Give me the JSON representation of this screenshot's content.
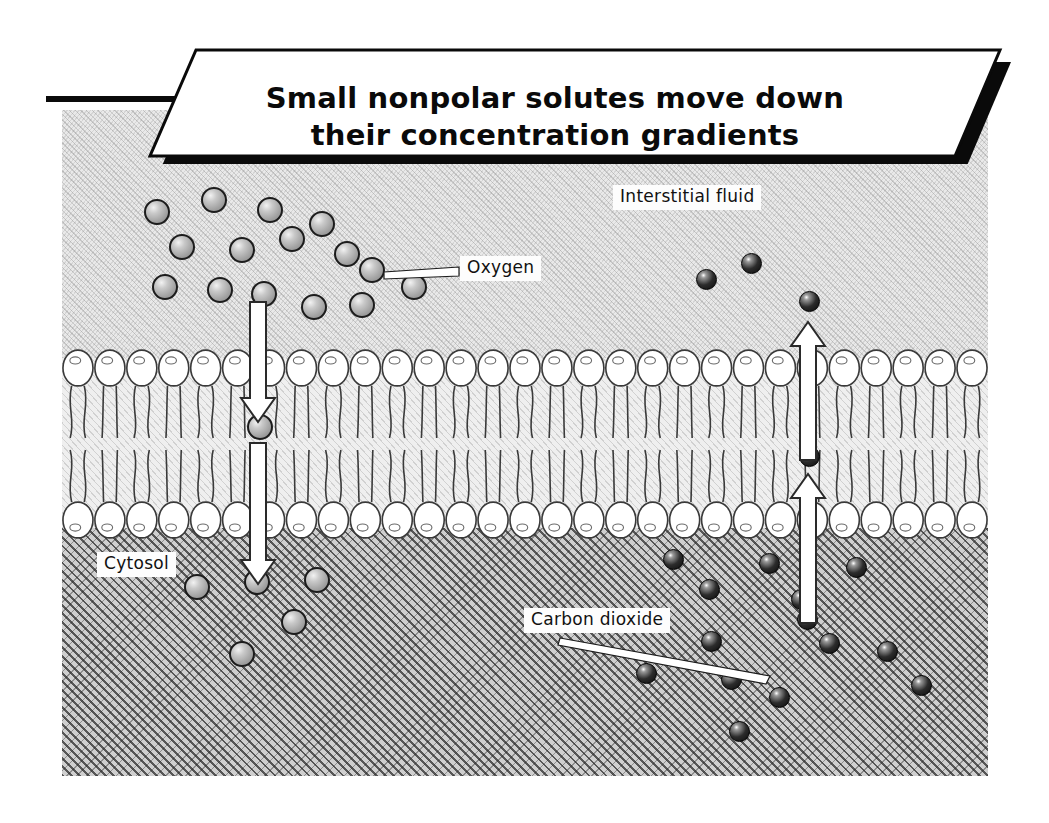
{
  "title": {
    "line1": "Small nonpolar solutes move down",
    "line2": "their concentration gradients"
  },
  "labels": {
    "interstitial_fluid": "Interstitial fluid",
    "cytosol": "Cytosol",
    "oxygen": "Oxygen",
    "carbon_dioxide": "Carbon dioxide"
  },
  "colors": {
    "oxygen_fill": "#9e9e9e",
    "oxygen_stroke": "#1c1c1c",
    "carbon_dioxide_fill": "#141414",
    "carbon_dioxide_stroke": "#000000",
    "interstitial_fluid_bg": "#e9e9e9",
    "cytosol_bg": "#cfcfcf",
    "membrane_bg": "#efefef",
    "phospholipid_head": "#ffffff",
    "banner_bg": "#ffffff",
    "banner_shadow": "#000000",
    "label_bg": "#fdfdfd",
    "text": "#0a0a0a"
  },
  "diagram": {
    "phospholipid_head_count_per_row": 29,
    "oxygen_molecules_interstitial": [
      {
        "x": 155,
        "y": 210
      },
      {
        "x": 212,
        "y": 198
      },
      {
        "x": 268,
        "y": 208
      },
      {
        "x": 320,
        "y": 222
      },
      {
        "x": 180,
        "y": 245
      },
      {
        "x": 240,
        "y": 248
      },
      {
        "x": 290,
        "y": 237
      },
      {
        "x": 345,
        "y": 252
      },
      {
        "x": 370,
        "y": 268
      },
      {
        "x": 163,
        "y": 285
      },
      {
        "x": 218,
        "y": 288
      },
      {
        "x": 262,
        "y": 292
      },
      {
        "x": 312,
        "y": 305
      },
      {
        "x": 360,
        "y": 303
      },
      {
        "x": 412,
        "y": 285
      }
    ],
    "oxygen_molecule_in_membrane": {
      "x": 258,
      "y": 425
    },
    "oxygen_molecules_cytosol": [
      {
        "x": 195,
        "y": 585
      },
      {
        "x": 255,
        "y": 580
      },
      {
        "x": 315,
        "y": 578
      },
      {
        "x": 292,
        "y": 620
      },
      {
        "x": 240,
        "y": 652
      }
    ],
    "co2_molecules_interstitial": [
      {
        "x": 705,
        "y": 278
      },
      {
        "x": 750,
        "y": 262
      },
      {
        "x": 808,
        "y": 300
      }
    ],
    "co2_molecule_in_membrane": {
      "x": 808,
      "y": 455
    },
    "co2_molecules_cytosol": [
      {
        "x": 672,
        "y": 558
      },
      {
        "x": 768,
        "y": 562
      },
      {
        "x": 855,
        "y": 566
      },
      {
        "x": 708,
        "y": 588
      },
      {
        "x": 800,
        "y": 598
      },
      {
        "x": 645,
        "y": 672
      },
      {
        "x": 710,
        "y": 640
      },
      {
        "x": 730,
        "y": 678
      },
      {
        "x": 806,
        "y": 618
      },
      {
        "x": 828,
        "y": 642
      },
      {
        "x": 886,
        "y": 650
      },
      {
        "x": 920,
        "y": 684
      },
      {
        "x": 738,
        "y": 730
      },
      {
        "x": 778,
        "y": 696
      }
    ],
    "arrows": [
      {
        "name": "oxygen-influx-arrow",
        "direction": "down",
        "from": "interstitial fluid",
        "to": "cytosol"
      },
      {
        "name": "co2-efflux-arrow",
        "direction": "up",
        "from": "cytosol",
        "to": "interstitial fluid"
      }
    ]
  }
}
